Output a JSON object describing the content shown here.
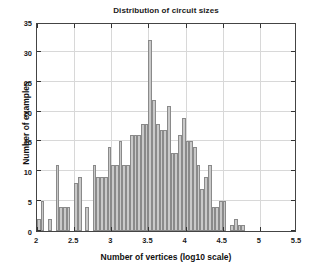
{
  "chart_data": {
    "type": "bar",
    "title": "Distribution of circuit sizes",
    "xlabel": "Number of vertices (log10 scale)",
    "ylabel": "Number of examples",
    "xlim": [
      2,
      5.5
    ],
    "ylim": [
      0,
      35
    ],
    "xticks": [
      2,
      2.5,
      3,
      3.5,
      4,
      4.5,
      5,
      5.5
    ],
    "xtick_labels": [
      "2",
      "2.5",
      "3",
      "3.5",
      "4",
      "4.5",
      "5",
      "5.5"
    ],
    "yticks": [
      0,
      5,
      10,
      15,
      20,
      25,
      30,
      35
    ],
    "ytick_labels": [
      "0",
      "5",
      "10",
      "15",
      "20",
      "25",
      "30",
      "35"
    ],
    "grid": true,
    "legend": "none",
    "bin_width": 0.05,
    "bar_color": "#c9c9c9",
    "bar_edge_color": "#8a8a8a",
    "bin_left_edges": [
      2.0,
      2.05,
      2.1,
      2.15,
      2.2,
      2.25,
      2.3,
      2.35,
      2.4,
      2.45,
      2.5,
      2.55,
      2.6,
      2.65,
      2.7,
      2.75,
      2.8,
      2.85,
      2.9,
      2.95,
      3.0,
      3.05,
      3.1,
      3.15,
      3.2,
      3.25,
      3.3,
      3.35,
      3.4,
      3.45,
      3.5,
      3.55,
      3.6,
      3.65,
      3.7,
      3.75,
      3.8,
      3.85,
      3.9,
      3.95,
      4.0,
      4.05,
      4.1,
      4.15,
      4.2,
      4.25,
      4.3,
      4.35,
      4.4,
      4.45,
      4.5,
      4.55,
      4.6,
      4.65,
      4.7,
      4.75,
      4.8,
      4.85,
      4.9,
      4.95,
      5.0,
      5.05,
      5.1,
      5.15
    ],
    "values": [
      2,
      5,
      0,
      2,
      0,
      11,
      4,
      4,
      4,
      0,
      8,
      9,
      0,
      4,
      0,
      11,
      9,
      9,
      9,
      14,
      11,
      11,
      15,
      11,
      11,
      16,
      16,
      16,
      18,
      18,
      32,
      22,
      18,
      17,
      17,
      21,
      13,
      13,
      16,
      19,
      15,
      15,
      14,
      11,
      7,
      9,
      11,
      4,
      4,
      5,
      5,
      0,
      1,
      2,
      1,
      1,
      0,
      0,
      0,
      0,
      0,
      0,
      0,
      0
    ]
  }
}
